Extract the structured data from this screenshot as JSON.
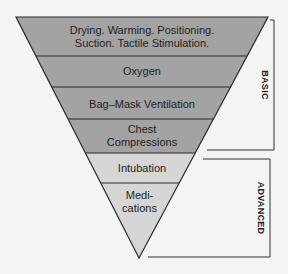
{
  "diagram": {
    "type": "inverted-pyramid",
    "colors": {
      "basic_fill": "#a3a3a3",
      "advanced_fill": "#d6d6d6",
      "stroke": "#2a2a2a",
      "background": "#f4f4f4"
    },
    "layers": [
      {
        "line1": "Drying. Warming. Positioning.",
        "line2": "Suction. Tactile Stimulation.",
        "group": "basic"
      },
      {
        "line1": "Oxygen",
        "group": "basic"
      },
      {
        "line1": "Bag–Mask Ventilation",
        "group": "basic"
      },
      {
        "line1": "Chest",
        "line2": "Compressions",
        "group": "basic"
      },
      {
        "line1": "Intubation",
        "group": "advanced"
      },
      {
        "line1": "Medi-",
        "line2": "cations",
        "group": "advanced"
      }
    ],
    "brackets": {
      "basic": "BASIC",
      "advanced": "ADVANCED"
    }
  }
}
